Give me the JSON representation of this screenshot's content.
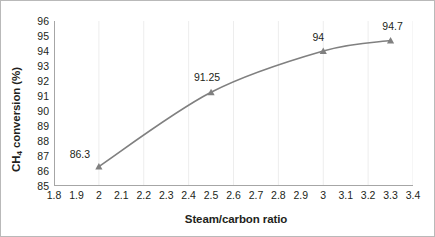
{
  "chart_data": {
    "type": "line",
    "title": "",
    "xlabel": "Steam/carbon ratio",
    "ylabel": "CH4 conversion (%)",
    "ylabel_parts": {
      "pre": "CH",
      "sub": "4",
      "post": " conversion (%)"
    },
    "x": [
      2,
      2.5,
      3,
      3.3
    ],
    "values": [
      86.3,
      91.25,
      94,
      94.7
    ],
    "point_labels": [
      "86.3",
      "91.25",
      "94",
      "94.7"
    ],
    "xlim": [
      1.8,
      3.4
    ],
    "ylim": [
      85,
      96
    ],
    "xticks": [
      1.8,
      1.9,
      2,
      2.1,
      2.2,
      2.3,
      2.4,
      2.5,
      2.6,
      2.7,
      2.8,
      2.9,
      3,
      3.1,
      3.2,
      3.3,
      3.4
    ],
    "xtick_labels": [
      "1.8",
      "1.9",
      "2",
      "2.1",
      "2.2",
      "2.3",
      "2.4",
      "2.5",
      "2.6",
      "2.7",
      "2.8",
      "2.9",
      "3",
      "3.1",
      "3.2",
      "3.3",
      "3.4"
    ],
    "yticks": [
      85,
      86,
      87,
      88,
      89,
      90,
      91,
      92,
      93,
      94,
      95,
      96
    ],
    "ytick_labels": [
      "85",
      "86",
      "87",
      "88",
      "89",
      "90",
      "91",
      "92",
      "93",
      "94",
      "95",
      "96"
    ],
    "grid": {
      "vertical": true,
      "vertical_step": 0.2,
      "horizontal": false
    },
    "marker": "triangle",
    "series_color": "#808080",
    "grid_color": "#ededed",
    "axis_color": "#a6a6a6",
    "text_color": "#231f20",
    "background": "#ffffff",
    "legend": null,
    "legend_position": "none",
    "annotations": []
  }
}
